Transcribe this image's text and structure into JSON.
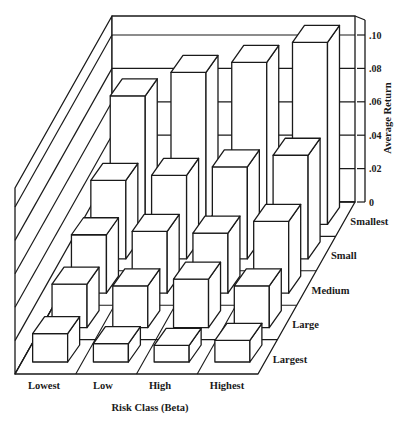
{
  "chart_data": {
    "type": "bar3d",
    "title": "",
    "xlabel": "Risk Class (Beta)",
    "ylabel": "Average Return",
    "zlabel": "",
    "x_categories": [
      "Lowest",
      "Low",
      "High",
      "Highest"
    ],
    "depth_categories": [
      "Smallest",
      "Small",
      "Medium",
      "Large",
      "Largest"
    ],
    "yticks": [
      "0",
      ".02",
      ".04",
      ".06",
      ".08",
      ".10"
    ],
    "ylim": [
      0,
      0.1
    ],
    "grid": true,
    "legend": null,
    "series": [
      {
        "name": "Smallest",
        "values": [
          0.077,
          0.091,
          0.097,
          0.109
        ]
      },
      {
        "name": "Small",
        "values": [
          0.047,
          0.05,
          0.055,
          0.062
        ]
      },
      {
        "name": "Medium",
        "values": [
          0.035,
          0.037,
          0.036,
          0.043
        ]
      },
      {
        "name": "Large",
        "values": [
          0.026,
          0.025,
          0.029,
          0.025
        ]
      },
      {
        "name": "Largest",
        "values": [
          0.017,
          0.011,
          0.01,
          0.013
        ]
      }
    ]
  },
  "colors": {
    "line": "#1a1a1a",
    "fill": "#ffffff"
  }
}
